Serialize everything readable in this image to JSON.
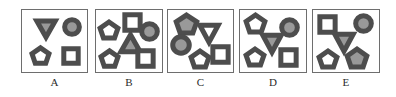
{
  "figure": {
    "width": 396,
    "height": 97,
    "background": "#ffffff",
    "panel_border_color": "#6e6e6e",
    "gray_fill": "#999999",
    "white_fill": "#ffffff",
    "shape_stroke": "#4d4d4d"
  },
  "panels": [
    {
      "id": "A",
      "label": "A",
      "box": {
        "x": 21,
        "y": 9,
        "w": 67,
        "h": 64
      },
      "label_box": {
        "x": 21,
        "y": 76,
        "w": 67
      },
      "shapes": [
        {
          "name": "triangle-down-gray",
          "type": "triangle-down",
          "fill": "gray",
          "x": 36,
          "y": 20,
          "w": 20,
          "h": 18
        },
        {
          "name": "circle-gray",
          "type": "circle",
          "fill": "gray",
          "x": 64,
          "y": 19,
          "w": 16,
          "h": 16
        },
        {
          "name": "pentagon-white",
          "type": "pentagon",
          "fill": "white",
          "x": 31,
          "y": 47,
          "w": 19,
          "h": 18
        },
        {
          "name": "square-white",
          "type": "square",
          "fill": "white",
          "x": 63,
          "y": 48,
          "w": 16,
          "h": 16
        }
      ]
    },
    {
      "id": "B",
      "label": "B",
      "box": {
        "x": 95,
        "y": 9,
        "w": 68,
        "h": 64
      },
      "label_box": {
        "x": 95,
        "y": 76,
        "w": 68
      },
      "shapes": [
        {
          "name": "pentagon-white-top",
          "type": "pentagon",
          "fill": "white",
          "x": 99,
          "y": 21,
          "w": 20,
          "h": 19
        },
        {
          "name": "square-white-top",
          "type": "square",
          "fill": "white",
          "x": 124,
          "y": 14,
          "w": 17,
          "h": 17
        },
        {
          "name": "circle-gray",
          "type": "circle",
          "fill": "gray",
          "x": 141,
          "y": 23,
          "w": 17,
          "h": 17
        },
        {
          "name": "triangle-up-gray",
          "type": "triangle-up",
          "fill": "gray",
          "x": 120,
          "y": 34,
          "w": 21,
          "h": 19
        },
        {
          "name": "pentagon-white-bottom",
          "type": "pentagon",
          "fill": "white",
          "x": 100,
          "y": 50,
          "w": 19,
          "h": 18
        },
        {
          "name": "square-white-bottom",
          "type": "square",
          "fill": "white",
          "x": 137,
          "y": 50,
          "w": 17,
          "h": 17
        }
      ]
    },
    {
      "id": "C",
      "label": "C",
      "box": {
        "x": 167,
        "y": 9,
        "w": 67,
        "h": 64
      },
      "label_box": {
        "x": 167,
        "y": 76,
        "w": 67
      },
      "shapes": [
        {
          "name": "pentagon-gray",
          "type": "pentagon",
          "fill": "gray",
          "x": 175,
          "y": 14,
          "w": 23,
          "h": 21
        },
        {
          "name": "triangle-down-white",
          "type": "triangle-down",
          "fill": "white",
          "x": 199,
          "y": 24,
          "w": 20,
          "h": 19
        },
        {
          "name": "circle-gray",
          "type": "circle",
          "fill": "gray",
          "x": 172,
          "y": 36,
          "w": 18,
          "h": 18
        },
        {
          "name": "pentagon-white",
          "type": "pentagon",
          "fill": "white",
          "x": 190,
          "y": 50,
          "w": 20,
          "h": 19
        },
        {
          "name": "square-white",
          "type": "square",
          "fill": "white",
          "x": 212,
          "y": 46,
          "w": 17,
          "h": 17
        }
      ]
    },
    {
      "id": "D",
      "label": "D",
      "box": {
        "x": 239,
        "y": 9,
        "w": 68,
        "h": 64
      },
      "label_box": {
        "x": 239,
        "y": 76,
        "w": 68
      },
      "shapes": [
        {
          "name": "pentagon-white-top",
          "type": "pentagon",
          "fill": "white",
          "x": 245,
          "y": 14,
          "w": 21,
          "h": 20
        },
        {
          "name": "circle-gray",
          "type": "circle",
          "fill": "gray",
          "x": 281,
          "y": 19,
          "w": 17,
          "h": 17
        },
        {
          "name": "triangle-down-gray",
          "type": "triangle-down",
          "fill": "gray",
          "x": 262,
          "y": 34,
          "w": 20,
          "h": 19
        },
        {
          "name": "pentagon-white-bottom",
          "type": "pentagon",
          "fill": "white",
          "x": 245,
          "y": 48,
          "w": 20,
          "h": 19
        },
        {
          "name": "square-white",
          "type": "square",
          "fill": "white",
          "x": 280,
          "y": 49,
          "w": 17,
          "h": 17
        }
      ]
    },
    {
      "id": "E",
      "label": "E",
      "box": {
        "x": 312,
        "y": 9,
        "w": 68,
        "h": 64
      },
      "label_box": {
        "x": 312,
        "y": 76,
        "w": 68
      },
      "shapes": [
        {
          "name": "square-white",
          "type": "square",
          "fill": "white",
          "x": 319,
          "y": 16,
          "w": 17,
          "h": 17
        },
        {
          "name": "circle-gray",
          "type": "circle",
          "fill": "gray",
          "x": 355,
          "y": 15,
          "w": 17,
          "h": 17
        },
        {
          "name": "triangle-down-gray",
          "type": "triangle-down",
          "fill": "gray",
          "x": 334,
          "y": 33,
          "w": 20,
          "h": 19
        },
        {
          "name": "pentagon-white",
          "type": "pentagon",
          "fill": "white",
          "x": 318,
          "y": 50,
          "w": 20,
          "h": 19
        },
        {
          "name": "pentagon-gray",
          "type": "pentagon",
          "fill": "gray",
          "x": 346,
          "y": 48,
          "w": 22,
          "h": 21
        }
      ]
    }
  ]
}
